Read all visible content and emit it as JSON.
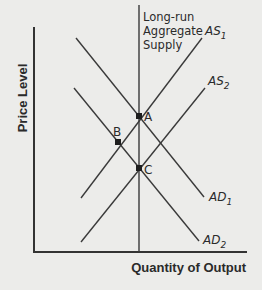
{
  "diagram": {
    "title": "",
    "axes": {
      "y_label": "Price Level",
      "x_label": "Quantity of Output"
    },
    "curves": {
      "lras": {
        "lines": [
          "Long-run",
          "Aggregate",
          "Supply"
        ]
      },
      "as1": {
        "base": "AS",
        "sub": "1"
      },
      "as2": {
        "base": "AS",
        "sub": "2"
      },
      "ad1": {
        "base": "AD",
        "sub": "1"
      },
      "ad2": {
        "base": "AD",
        "sub": "2"
      }
    },
    "points": {
      "a": "A",
      "b": "B",
      "c": "C"
    },
    "colors": {
      "line": "#3a3a3a",
      "background": "#ececea"
    }
  }
}
